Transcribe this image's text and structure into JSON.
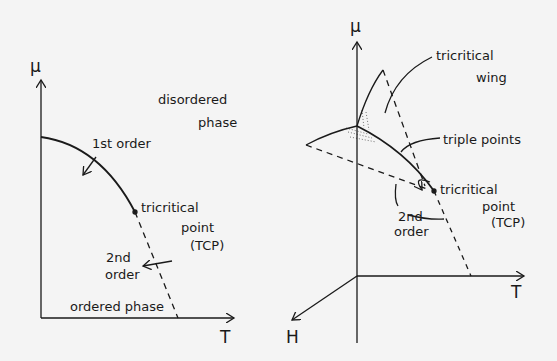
{
  "left_diagram": {
    "axes": {
      "y_label": "μ",
      "x_label": "T"
    },
    "regions": {
      "upper": [
        "disordered",
        "phase"
      ],
      "lower": "ordered phase"
    },
    "annotations": {
      "first_order": "1st order",
      "tcp": [
        "tricritical",
        "point",
        "(TCP)"
      ],
      "second_order": [
        "2nd",
        "order"
      ]
    }
  },
  "right_diagram": {
    "axes": {
      "y_label": "μ",
      "x_label": "T",
      "z_label": "H"
    },
    "annotations": {
      "wing": [
        "tricritical",
        "wing"
      ],
      "triple": "triple points",
      "tcp": [
        "tricritical",
        "point",
        "(TCP)"
      ],
      "second_order": [
        "2nd",
        "order"
      ]
    }
  },
  "colors": {
    "ink": "#1a1a1a",
    "paper": "#f4f4f4"
  }
}
